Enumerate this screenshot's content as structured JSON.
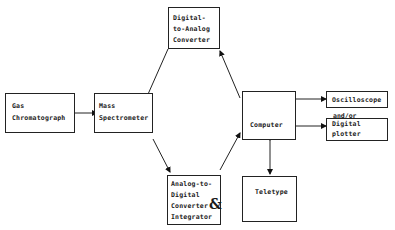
{
  "diagram": {
    "nodes": {
      "gas_chromatograph": {
        "lines": [
          "Gas",
          "Chromatograph"
        ]
      },
      "mass_spectrometer": {
        "lines": [
          "Mass",
          "Spectrometer"
        ]
      },
      "dac": {
        "lines": [
          "Digital-",
          "to-Analog",
          "Converter"
        ]
      },
      "adc": {
        "lines": [
          "Analog-to-",
          "Digital",
          "Converter",
          "Integrator"
        ],
        "ampersand": "&"
      },
      "computer": {
        "lines": [
          "Computer"
        ]
      },
      "teletype": {
        "lines": [
          "Teletype"
        ]
      },
      "oscilloscope": {
        "lines": [
          "Oscilloscope"
        ]
      },
      "digital_plotter": {
        "lines": [
          "Digital",
          "plotter"
        ]
      }
    },
    "annotations": {
      "and_or": "and/or"
    },
    "edges": [
      {
        "from": "Gas Chromatograph",
        "to": "Mass Spectrometer",
        "direction": "forward"
      },
      {
        "from": "Digital-to-Analog Converter",
        "to": "Mass Spectrometer",
        "direction": "forward"
      },
      {
        "from": "Mass Spectrometer",
        "to": "Analog-to-Digital Converter & Integrator",
        "direction": "forward"
      },
      {
        "from": "Analog-to-Digital Converter & Integrator",
        "to": "Computer",
        "direction": "forward"
      },
      {
        "from": "Computer",
        "to": "Digital-to-Analog Converter",
        "direction": "forward"
      },
      {
        "from": "Computer",
        "to": "Oscilloscope",
        "direction": "forward"
      },
      {
        "from": "Computer",
        "to": "Digital plotter",
        "direction": "forward"
      },
      {
        "from": "Computer",
        "to": "Teletype",
        "direction": "bidirectional"
      }
    ]
  }
}
